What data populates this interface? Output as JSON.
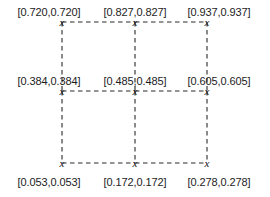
{
  "diagram": {
    "type": "grid-lattice",
    "marker_glyph": "x",
    "line_style": "dashed",
    "line_color": "#2b2b2b",
    "text_color": "#1c1c1c",
    "background_color": "#ffffff",
    "columns": 3,
    "rows": 3,
    "nodes": [
      {
        "id": "n00",
        "label": "[0.720,0.720]",
        "x": 62,
        "y": 22,
        "label_x": 49,
        "label_y": 6,
        "label_anchor": "above"
      },
      {
        "id": "n01",
        "label": "[0.827,0.827]",
        "x": 135,
        "y": 22,
        "label_x": 135,
        "label_y": 6,
        "label_anchor": "above"
      },
      {
        "id": "n02",
        "label": "[0.937,0.937]",
        "x": 207,
        "y": 22,
        "label_x": 219,
        "label_y": 6,
        "label_anchor": "above"
      },
      {
        "id": "n10",
        "label": "[0.384,0.384]",
        "x": 62,
        "y": 91,
        "label_x": 49,
        "label_y": 75,
        "label_anchor": "above"
      },
      {
        "id": "n11",
        "label": "[0.485,0.485]",
        "x": 135,
        "y": 91,
        "label_x": 135,
        "label_y": 75,
        "label_anchor": "above"
      },
      {
        "id": "n12",
        "label": "[0.605,0.605]",
        "x": 207,
        "y": 91,
        "label_x": 219,
        "label_y": 75,
        "label_anchor": "above"
      },
      {
        "id": "n20",
        "label": "[0.053,0.053]",
        "x": 62,
        "y": 163,
        "label_x": 49,
        "label_y": 176,
        "label_anchor": "below"
      },
      {
        "id": "n21",
        "label": "[0.172,0.172]",
        "x": 135,
        "y": 163,
        "label_x": 135,
        "label_y": 176,
        "label_anchor": "below"
      },
      {
        "id": "n22",
        "label": "[0.278,0.278]",
        "x": 207,
        "y": 163,
        "label_x": 219,
        "label_y": 176,
        "label_anchor": "below"
      }
    ],
    "edges": [
      {
        "id": "e-top-left",
        "x1": 62,
        "y1": 22,
        "x2": 135,
        "y2": 22
      },
      {
        "id": "e-top-right",
        "x1": 135,
        "y1": 22,
        "x2": 207,
        "y2": 22
      },
      {
        "id": "e-mid-left",
        "x1": 62,
        "y1": 91,
        "x2": 135,
        "y2": 91
      },
      {
        "id": "e-mid-right",
        "x1": 135,
        "y1": 91,
        "x2": 207,
        "y2": 91
      },
      {
        "id": "e-bot-left",
        "x1": 62,
        "y1": 163,
        "x2": 135,
        "y2": 163
      },
      {
        "id": "e-bot-right",
        "x1": 135,
        "y1": 163,
        "x2": 207,
        "y2": 163
      },
      {
        "id": "e-col1-upper",
        "x1": 62,
        "y1": 22,
        "x2": 62,
        "y2": 91
      },
      {
        "id": "e-col1-lower",
        "x1": 62,
        "y1": 91,
        "x2": 62,
        "y2": 163
      },
      {
        "id": "e-col2-upper",
        "x1": 135,
        "y1": 22,
        "x2": 135,
        "y2": 91
      },
      {
        "id": "e-col2-lower",
        "x1": 135,
        "y1": 91,
        "x2": 135,
        "y2": 163
      },
      {
        "id": "e-col3-upper",
        "x1": 207,
        "y1": 22,
        "x2": 207,
        "y2": 91
      },
      {
        "id": "e-col3-lower",
        "x1": 207,
        "y1": 91,
        "x2": 207,
        "y2": 163
      }
    ]
  }
}
